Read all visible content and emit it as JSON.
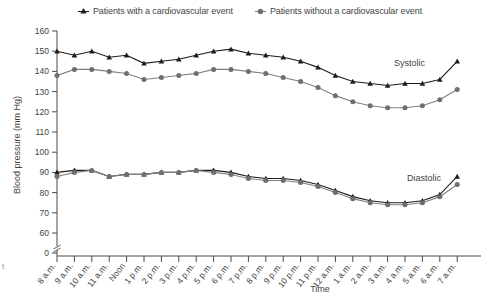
{
  "legend": {
    "items": [
      {
        "label": "Patients with a cardiovascular event",
        "marker": "triangle-marker",
        "color": "#1c1c1c"
      },
      {
        "label": "Patients without a cardiovascular event",
        "marker": "circle-marker",
        "color": "#808080"
      }
    ]
  },
  "corner_mark": "t",
  "annotations": {
    "systolic": "Systolic",
    "diastolic": "Diastolic"
  },
  "chart_data": {
    "type": "line",
    "title": "",
    "xlabel": "Time",
    "ylabel": "Blood pressure (mm Hg)",
    "ylim": [
      60,
      160
    ],
    "yticks": [
      0,
      60,
      70,
      80,
      90,
      100,
      110,
      120,
      130,
      140,
      150,
      160
    ],
    "y_axis_break": true,
    "grid": false,
    "legend_position": "top-center",
    "categories": [
      "8 a.m.",
      "9 a.m.",
      "10 a.m.",
      "11 a.m.",
      "Noon",
      "1 p.m.",
      "2 p.m.",
      "3 p.m.",
      "4 p.m.",
      "5 p.m.",
      "6 p.m.",
      "7 p.m.",
      "8 p.m.",
      "9 p.m.",
      "10 p.m.",
      "11 p.m.",
      "12 a.m.",
      "1 a.m.",
      "2 a.m.",
      "3 a.m.",
      "4 a.m.",
      "5 a.m.",
      "6 a.m.",
      "7 a.m."
    ],
    "series": [
      {
        "name": "Patients with a cardiovascular event",
        "measure": "Systolic",
        "marker": "triangle-marker",
        "color": "#1c1c1c",
        "values": [
          150,
          148,
          150,
          147,
          148,
          144,
          145,
          146,
          148,
          150,
          151,
          149,
          148,
          147,
          145,
          142,
          138,
          135,
          134,
          133,
          134,
          134,
          136,
          145
        ]
      },
      {
        "name": "Patients without a cardiovascular event",
        "measure": "Systolic",
        "marker": "circle-marker",
        "color": "#808080",
        "values": [
          138,
          141,
          141,
          140,
          139,
          136,
          137,
          138,
          139,
          141,
          141,
          140,
          139,
          137,
          135,
          132,
          128,
          125,
          123,
          122,
          122,
          123,
          126,
          131
        ]
      },
      {
        "name": "Patients with a cardiovascular event",
        "measure": "Diastolic",
        "marker": "triangle-marker",
        "color": "#1c1c1c",
        "values": [
          90,
          91,
          91,
          88,
          89,
          89,
          90,
          90,
          91,
          91,
          90,
          88,
          87,
          87,
          86,
          84,
          81,
          78,
          76,
          75,
          75,
          76,
          79,
          88
        ]
      },
      {
        "name": "Patients without a cardiovascular event",
        "measure": "Diastolic",
        "marker": "circle-marker",
        "color": "#808080",
        "values": [
          88,
          90,
          91,
          88,
          89,
          89,
          90,
          90,
          91,
          90,
          89,
          87,
          86,
          86,
          85,
          83,
          80,
          77,
          75,
          74,
          74,
          75,
          78,
          84
        ]
      }
    ]
  }
}
